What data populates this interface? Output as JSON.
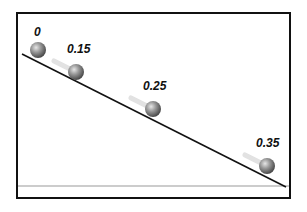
{
  "diagram": {
    "type": "inclined-plane-motion",
    "frame": {
      "x": 17,
      "y": 13,
      "width": 273,
      "height": 185,
      "stroke": "#111111"
    },
    "ground": {
      "y": 186,
      "color": "#9a9a9a"
    },
    "incline": {
      "x1": 22,
      "y1": 54,
      "x2": 286,
      "y2": 187,
      "color": "#111111"
    },
    "ball_color": {
      "light": "#d8d8d8",
      "mid": "#8e8e8e",
      "dark": "#4a4a4a"
    },
    "balls": [
      {
        "label": "0",
        "cx": 38,
        "cy": 50,
        "r": 8,
        "label_x": 34,
        "label_y": 36
      },
      {
        "label": "0.15",
        "cx": 76,
        "cy": 72,
        "r": 8,
        "label_x": 67,
        "label_y": 53
      },
      {
        "label": "0.25",
        "cx": 153,
        "cy": 109,
        "r": 8,
        "label_x": 143,
        "label_y": 90
      },
      {
        "label": "0.35",
        "cx": 267,
        "cy": 166,
        "r": 8,
        "label_x": 256,
        "label_y": 147
      }
    ]
  }
}
